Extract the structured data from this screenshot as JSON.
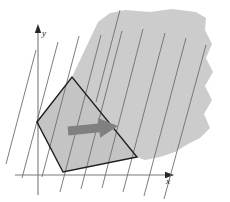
{
  "figure": {
    "type": "linear-programming-diagram",
    "title": "",
    "axes": {
      "x_label": "x",
      "y_label": "y",
      "x_axis": {
        "x1": 15,
        "y1": 175,
        "x2": 168,
        "y2": 175
      },
      "y_axis": {
        "x1": 38,
        "y1": 195,
        "x2": 38,
        "y2": 30
      },
      "axis_color": "#7a7a7a",
      "arrow_color": "#262626",
      "x_label_pos": {
        "x": 168,
        "y": 184
      },
      "y_label_pos": {
        "x": 44,
        "y": 36
      }
    },
    "shaded_region": {
      "name": "constraint-shadow-region",
      "fill_color": "#cccccc",
      "description": "large irregular torn-edge gray region in upper right",
      "points": "37,122 72,77 98,22 110,13 126,10 150,12 172,9 196,12 206,18 205,30 212,44 206,58 213,72 205,86 212,100 204,114 210,128 200,138 188,144 175,152 160,157 145,160 137,157"
    },
    "feasible_polygon": {
      "name": "feasible-region-polygon",
      "fill_color": "#c4c4c4",
      "stroke_color": "#1f1f1f",
      "stroke_width": 1.4,
      "vertices": [
        {
          "x": 37,
          "y": 122
        },
        {
          "x": 72,
          "y": 77
        },
        {
          "x": 137,
          "y": 157
        },
        {
          "x": 63,
          "y": 172
        }
      ]
    },
    "level_lines": {
      "name": "objective-level-lines",
      "color": "#6e6e6e",
      "stroke_width": 0.9,
      "count": 10,
      "slope_dx": -38,
      "slope_dy": 144,
      "description": "family of parallel level sets of the objective function, steep negative slope",
      "lines": [
        {
          "x1": 36,
          "y1": 50,
          "x2": 6,
          "y2": 164
        },
        {
          "x1": 58,
          "y1": 42,
          "x2": 22,
          "y2": 178
        },
        {
          "x1": 79,
          "y1": 36,
          "x2": 42,
          "y2": 177
        },
        {
          "x1": 101,
          "y1": 35,
          "x2": 60,
          "y2": 192
        },
        {
          "x1": 122,
          "y1": 31,
          "x2": 81,
          "y2": 189
        },
        {
          "x1": 143,
          "y1": 29,
          "x2": 102,
          "y2": 188
        },
        {
          "x1": 165,
          "y1": 33,
          "x2": 123,
          "y2": 192
        },
        {
          "x1": 186,
          "y1": 38,
          "x2": 144,
          "y2": 196
        },
        {
          "x1": 206,
          "y1": 45,
          "x2": 164,
          "y2": 199
        },
        {
          "x1": 120,
          "y1": 10,
          "x2": 96,
          "y2": 102
        }
      ]
    },
    "direction_arrow": {
      "name": "objective-direction-arrow",
      "color": "#808080",
      "description": "thick gray arrow pointing right, indicating direction of increasing objective",
      "tail_x": 68,
      "tail_y": 131,
      "head_x": 118,
      "head_y": 126,
      "shaft_thickness": 9,
      "head_width": 20,
      "head_height": 19
    }
  }
}
